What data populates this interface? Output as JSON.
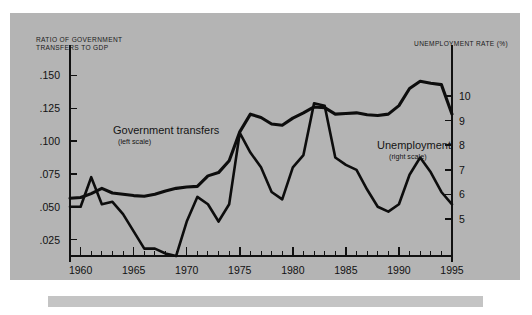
{
  "figure": {
    "background_color": "#b4b4b4",
    "page_color": "#ffffff",
    "bottom_bar_color": "#c4c4c4"
  },
  "left_axis_title": "RATIO OF GOVERNMENT\nTRANSFERS TO GDP",
  "right_axis_title": "UNEMPLOYMENT RATE (%)",
  "series_labels": {
    "transfers": {
      "main": "Government transfers",
      "sub": "(left scale)"
    },
    "unemployment": {
      "main": "Unemployment",
      "sub": "(right scale)"
    }
  },
  "y_left_ticks": [
    ".025",
    ".050",
    ".075",
    ".100",
    ".125",
    ".150"
  ],
  "y_right_ticks": [
    "5",
    "6",
    "7",
    "8",
    "9",
    "10"
  ],
  "x_ticks": [
    "1960",
    "1965",
    "1970",
    "1975",
    "1980",
    "1985",
    "1990",
    "1995"
  ],
  "chart_data": {
    "type": "line",
    "title": "",
    "xlabel": "",
    "ylabel": "Ratio of government transfers to GDP",
    "y2label": "Unemployment rate (%)",
    "grid": false,
    "legend": "inline-annotations",
    "xlim": [
      1959,
      1995
    ],
    "ylim": [
      0.0125,
      0.1625
    ],
    "y2lim": [
      3.5,
      11.5
    ],
    "y_ticks": [
      0.025,
      0.05,
      0.075,
      0.1,
      0.125,
      0.15
    ],
    "y2_ticks": [
      5,
      6,
      7,
      8,
      9,
      10
    ],
    "x_major_ticks": [
      1960,
      1965,
      1970,
      1975,
      1980,
      1985,
      1990,
      1995
    ],
    "x_minor_tick_interval": 1,
    "x": [
      1959,
      1960,
      1961,
      1962,
      1963,
      1964,
      1965,
      1966,
      1967,
      1968,
      1969,
      1970,
      1971,
      1972,
      1973,
      1974,
      1975,
      1976,
      1977,
      1978,
      1979,
      1980,
      1981,
      1982,
      1983,
      1984,
      1985,
      1986,
      1987,
      1988,
      1989,
      1990,
      1991,
      1992,
      1993,
      1994,
      1995
    ],
    "series": [
      {
        "name": "Government transfers",
        "axis": "left",
        "units": "ratio to GDP",
        "values": [
          0.0565,
          0.057,
          0.06,
          0.064,
          0.0605,
          0.0595,
          0.0585,
          0.058,
          0.0595,
          0.062,
          0.064,
          0.065,
          0.0655,
          0.0735,
          0.076,
          0.085,
          0.107,
          0.1205,
          0.118,
          0.113,
          0.112,
          0.1175,
          0.1215,
          0.126,
          0.1255,
          0.1205,
          0.121,
          0.1215,
          0.12,
          0.1195,
          0.1205,
          0.127,
          0.14,
          0.1455,
          0.144,
          0.143,
          0.1205
        ]
      },
      {
        "name": "Unemployment",
        "axis": "right",
        "units": "percent",
        "values": [
          5.5,
          5.5,
          6.7,
          5.6,
          5.7,
          5.2,
          4.5,
          3.8,
          3.8,
          3.6,
          3.5,
          4.9,
          5.9,
          5.6,
          4.9,
          5.6,
          8.5,
          7.7,
          7.1,
          6.1,
          5.8,
          7.1,
          7.6,
          9.7,
          9.6,
          7.5,
          7.2,
          7.0,
          6.2,
          5.5,
          5.3,
          5.6,
          6.8,
          7.5,
          6.9,
          6.1,
          5.6
        ]
      }
    ]
  }
}
